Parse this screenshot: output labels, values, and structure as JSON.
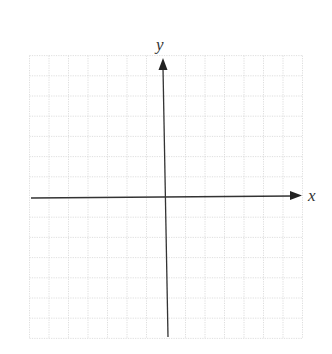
{
  "diagram": {
    "type": "cartesian-coordinate-grid",
    "x_axis_label": "x",
    "y_axis_label": "y",
    "grid": {
      "x_min": -7,
      "x_max": 7,
      "y_min": -7,
      "y_max": 7,
      "step": 1,
      "line_style": "dotted",
      "grid_color": "#d6d6d6",
      "axis_color": "#333333"
    },
    "axes": {
      "x_arrow": "positive",
      "y_arrow": "positive"
    }
  }
}
